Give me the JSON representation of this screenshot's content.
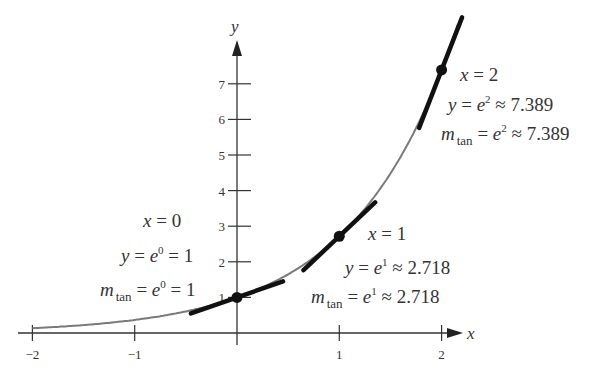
{
  "chart_data": {
    "type": "line",
    "title": "",
    "function": "y = e^x",
    "xlabel": "x",
    "ylabel": "y",
    "xlim": [
      -2,
      2.16
    ],
    "ylim": [
      0,
      8.7
    ],
    "grid": false,
    "x_ticks": [
      -2,
      -1,
      1,
      2
    ],
    "x_tick_labels": [
      "−2",
      "−1",
      "1",
      "2"
    ],
    "y_ticks": [
      1,
      2,
      3,
      4,
      5,
      6,
      7
    ],
    "y_tick_labels": [
      "1",
      "2",
      "3",
      "4",
      "5",
      "6",
      "7"
    ],
    "series": [
      {
        "name": "y = e^x",
        "x": [
          -2,
          -1.5,
          -1,
          -0.5,
          0,
          0.5,
          1,
          1.5,
          2,
          2.16
        ],
        "y": [
          0.135,
          0.223,
          0.368,
          0.607,
          1,
          1.649,
          2.718,
          4.482,
          7.389,
          8.67
        ]
      }
    ],
    "tangent_points": [
      {
        "x": 0,
        "y": 1,
        "slope": 1,
        "x_range": [
          -0.45,
          0.45
        ]
      },
      {
        "x": 1,
        "y": 2.718,
        "slope": 2.718,
        "x_range": [
          -0.35,
          0.35
        ]
      },
      {
        "x": 2,
        "y": 7.389,
        "slope": 7.389,
        "x_range": [
          -0.22,
          0.2
        ]
      }
    ],
    "annotations": [
      {
        "point": "x=0",
        "lines": [
          "x = 0",
          "y = e⁰ = 1",
          "m_tan = e⁰ = 1"
        ]
      },
      {
        "point": "x=1",
        "lines": [
          "x = 1",
          "y = e¹ ≈ 2.718",
          "m_tan = e¹ ≈ 2.718"
        ]
      },
      {
        "point": "x=2",
        "lines": [
          "x = 2",
          "y = e² ≈ 7.389",
          "m_tan = e² ≈ 7.389"
        ]
      }
    ]
  },
  "labels": {
    "x_axis": "x",
    "y_axis": "y",
    "xticks": [
      "−2",
      "−1",
      "1",
      "2"
    ],
    "yticks": [
      "1",
      "2",
      "3",
      "4",
      "5",
      "6",
      "7"
    ],
    "ann0": {
      "l1_var": "x",
      "l1_rest": " = 0",
      "l2_var": "y",
      "l2_a": " = ",
      "l2_e": "e",
      "l2_sup": "0",
      "l2_b": " = 1",
      "l3_m": "m",
      "l3_sub": "tan",
      "l3_a": " = ",
      "l3_e": "e",
      "l3_sup": "0",
      "l3_b": " = 1"
    },
    "ann1": {
      "l1_var": "x",
      "l1_rest": " = 1",
      "l2_var": "y",
      "l2_a": " = ",
      "l2_e": "e",
      "l2_sup": "1",
      "l2_b": " ≈ 2.718",
      "l3_m": "m",
      "l3_sub": "tan",
      "l3_a": " = ",
      "l3_e": "e",
      "l3_sup": "1",
      "l3_b": " ≈ 2.718"
    },
    "ann2": {
      "l1_var": "x",
      "l1_rest": " = 2",
      "l2_var": "y",
      "l2_a": " = ",
      "l2_e": "e",
      "l2_sup": "2",
      "l2_b": " ≈ 7.389",
      "l3_m": "m",
      "l3_sub": "tan",
      "l3_a": " = ",
      "l3_e": "e",
      "l3_sup": "2",
      "l3_b": " ≈ 7.389"
    }
  },
  "colors": {
    "curve": "#7a7a7a",
    "tangent": "#111111",
    "axis": "#333333",
    "text": "#333333"
  }
}
